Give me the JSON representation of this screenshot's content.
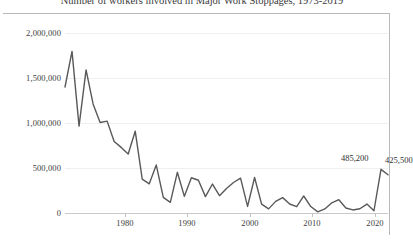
{
  "chart_data": {
    "type": "line",
    "title": "Number of workers involved in Major Work Stoppages, 1973-2019",
    "xlabel": "",
    "ylabel": "",
    "xlim": [
      1973,
      2019
    ],
    "ylim": [
      0,
      2000000
    ],
    "grid": true,
    "legend": false,
    "legend_position": "none",
    "line_color": "#595959",
    "y_ticks": [
      {
        "value": 2000000,
        "label": "2,000,000"
      },
      {
        "value": 1500000,
        "label": "1,500,000"
      },
      {
        "value": 1000000,
        "label": "1,000,000"
      },
      {
        "value": 500000,
        "label": "500,000"
      },
      {
        "value": 0,
        "label": "0"
      }
    ],
    "x_ticks": [
      {
        "value": 1980,
        "label": "1980"
      },
      {
        "value": 1990,
        "label": "1990"
      },
      {
        "value": 2000,
        "label": "2000"
      },
      {
        "value": 2010,
        "label": "2010"
      },
      {
        "value": 2020,
        "label": "2020"
      }
    ],
    "x": [
      1973,
      1974,
      1975,
      1976,
      1977,
      1978,
      1979,
      1980,
      1981,
      1982,
      1983,
      1984,
      1985,
      1986,
      1987,
      1988,
      1989,
      1990,
      1991,
      1992,
      1993,
      1994,
      1995,
      1996,
      1997,
      1998,
      1999,
      2000,
      2001,
      2002,
      2003,
      2004,
      2005,
      2006,
      2007,
      2008,
      2009,
      2010,
      2011,
      2012,
      2013,
      2014,
      2015,
      2016,
      2017,
      2018,
      2019
    ],
    "values": [
      1400000,
      1796000,
      965000,
      1590000,
      1212000,
      1006000,
      1021000,
      795000,
      729000,
      656000,
      909000,
      376000,
      324000,
      533000,
      174000,
      118000,
      452000,
      185000,
      392000,
      364000,
      182000,
      322000,
      192000,
      273000,
      339000,
      387000,
      73000,
      394000,
      99000,
      46000,
      129000,
      171000,
      100000,
      70000,
      189000,
      72000,
      13000,
      45000,
      113000,
      148000,
      55000,
      34000,
      47000,
      99000,
      25000,
      485200,
      425500
    ],
    "annotations": [
      {
        "label": "485,200",
        "x": 2018,
        "y": 485200
      },
      {
        "label": "425,500",
        "x": 2019,
        "y": 425500
      }
    ]
  }
}
